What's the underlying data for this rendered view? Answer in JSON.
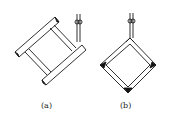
{
  "figure": {
    "panels": [
      {
        "id": "a",
        "caption": "(a)",
        "description": "Rectangular frame tilted on a hook (hanging off-center)"
      },
      {
        "id": "b",
        "caption": "(b)",
        "description": "Square frame hung from a corner on a hook"
      }
    ],
    "colors": {
      "stroke": "#1a1a1a",
      "background": "#ffffff",
      "fill": "#111111"
    }
  }
}
